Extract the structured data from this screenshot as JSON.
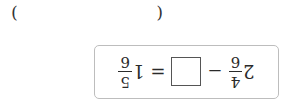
{
  "orientation": "rotated-180",
  "answer": {
    "left_paren": "(",
    "right_paren": ")",
    "value": ""
  },
  "equation": {
    "minuend": {
      "whole": "2",
      "numerator": "4",
      "denominator": "6"
    },
    "minus": "−",
    "blank_value": "",
    "equals": "=",
    "result": {
      "whole": "1",
      "numerator": "5",
      "denominator": "6"
    }
  },
  "colors": {
    "text": "#2a2a2a",
    "box_border": "#bdbdbd",
    "blank_border": "#555555"
  }
}
